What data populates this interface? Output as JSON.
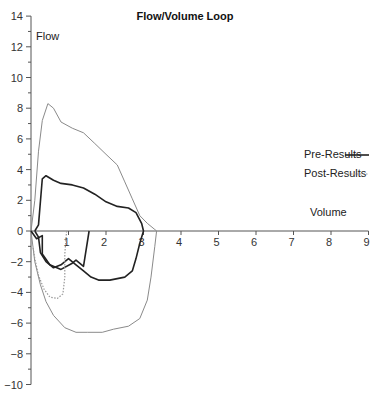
{
  "chart_data": {
    "type": "line",
    "title": "Flow/Volume Loop",
    "xlabel": "Volume",
    "ylabel": "Flow",
    "xlim": [
      0,
      9
    ],
    "ylim": [
      -10,
      14
    ],
    "x_ticks": [
      1,
      2,
      3,
      4,
      5,
      6,
      7,
      8,
      9
    ],
    "y_ticks": [
      -10,
      -8,
      -6,
      -4,
      -2,
      0,
      2,
      4,
      6,
      8,
      10,
      12,
      14
    ],
    "grid": false,
    "legend_position": "right",
    "legend": [
      {
        "label": "Pre-Results",
        "style": "solid",
        "color": "#222222"
      },
      {
        "label": "Post-Results",
        "style": "dotted",
        "color": "#999999"
      }
    ],
    "series": [
      {
        "name": "Predicted",
        "style": "solid-thin",
        "color": "#8a8a8a",
        "points": [
          [
            0,
            0
          ],
          [
            0.1,
            2
          ],
          [
            0.2,
            5.2
          ],
          [
            0.3,
            7.2
          ],
          [
            0.45,
            8.3
          ],
          [
            0.6,
            8.0
          ],
          [
            0.8,
            7.1
          ],
          [
            1.1,
            6.7
          ],
          [
            1.4,
            6.4
          ],
          [
            1.7,
            5.7
          ],
          [
            2.0,
            5.0
          ],
          [
            2.3,
            4.3
          ],
          [
            2.5,
            3.2
          ],
          [
            2.7,
            2.1
          ],
          [
            2.9,
            1.0
          ],
          [
            3.1,
            0.5
          ],
          [
            3.3,
            0.1
          ],
          [
            3.35,
            0
          ],
          [
            3.3,
            -1.0
          ],
          [
            3.2,
            -3.0
          ],
          [
            3.1,
            -4.5
          ],
          [
            2.9,
            -5.7
          ],
          [
            2.6,
            -6.2
          ],
          [
            2.2,
            -6.4
          ],
          [
            1.9,
            -6.6
          ],
          [
            1.5,
            -6.6
          ],
          [
            1.2,
            -6.6
          ],
          [
            0.9,
            -6.3
          ],
          [
            0.6,
            -5.5
          ],
          [
            0.4,
            -4.6
          ],
          [
            0.25,
            -3.5
          ],
          [
            0.1,
            -2.0
          ],
          [
            0.05,
            -1.0
          ],
          [
            0,
            0
          ]
        ]
      },
      {
        "name": "Pre-Results",
        "style": "solid",
        "color": "#222222",
        "points": [
          [
            0.1,
            0
          ],
          [
            0.2,
            0.4
          ],
          [
            0.3,
            3.4
          ],
          [
            0.4,
            3.6
          ],
          [
            0.6,
            3.3
          ],
          [
            0.8,
            3.1
          ],
          [
            1.1,
            3.0
          ],
          [
            1.4,
            2.8
          ],
          [
            1.7,
            2.4
          ],
          [
            2.0,
            1.9
          ],
          [
            2.3,
            1.6
          ],
          [
            2.6,
            1.5
          ],
          [
            2.8,
            1.2
          ],
          [
            2.95,
            0.5
          ],
          [
            3.0,
            0
          ],
          [
            2.9,
            -0.8
          ],
          [
            2.8,
            -1.8
          ],
          [
            2.7,
            -2.6
          ],
          [
            2.5,
            -3.0
          ],
          [
            2.1,
            -3.2
          ],
          [
            1.8,
            -3.2
          ],
          [
            1.6,
            -3.0
          ],
          [
            1.4,
            -2.6
          ],
          [
            1.2,
            -2.2
          ],
          [
            1.0,
            -1.8
          ],
          [
            0.8,
            -2.2
          ],
          [
            0.6,
            -2.4
          ],
          [
            0.4,
            -2.0
          ],
          [
            0.25,
            -1.4
          ],
          [
            0.2,
            -0.4
          ],
          [
            0.1,
            0
          ]
        ]
      },
      {
        "name": "Pre-Results-Inspiratory",
        "style": "solid",
        "color": "#222222",
        "points": [
          [
            0,
            0
          ],
          [
            0.15,
            -0.5
          ],
          [
            0.3,
            -0.3
          ],
          [
            0.3,
            -1.5
          ],
          [
            0.5,
            -2.2
          ],
          [
            0.8,
            -2.5
          ],
          [
            1.1,
            -2.1
          ],
          [
            1.2,
            -1.9
          ],
          [
            1.4,
            -2.3
          ],
          [
            1.55,
            0
          ]
        ]
      },
      {
        "name": "Post-Results",
        "style": "dotted",
        "color": "#999999",
        "points": [
          [
            0.95,
            0
          ],
          [
            0.9,
            -1.5
          ],
          [
            0.9,
            -3.0
          ],
          [
            0.85,
            -4.1
          ],
          [
            0.7,
            -4.4
          ],
          [
            0.5,
            -4.3
          ],
          [
            0.35,
            -3.8
          ],
          [
            0.2,
            -2.9
          ],
          [
            0.1,
            -1.8
          ],
          [
            0.05,
            -1.0
          ]
        ]
      }
    ]
  }
}
